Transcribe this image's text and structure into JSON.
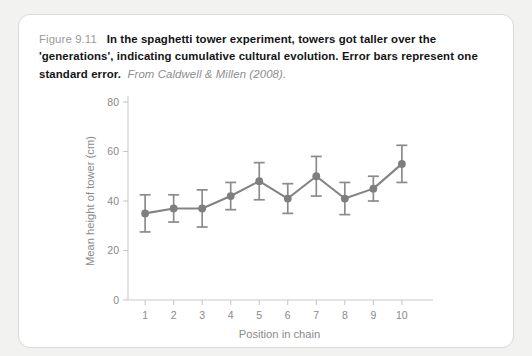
{
  "figure": {
    "label": "Figure 9.11",
    "caption_bold": "In the spaghetti tower experiment, towers got taller over the 'generations', indicating cumulative cultural evolution. Error bars represent one standard error.",
    "source": "From Caldwell & Millen (2008)."
  },
  "colors": {
    "series": "#7e7e7e",
    "axis": "#c9c9c9",
    "axis_text": "#8a8a8a",
    "card_border": "#d9d9d9",
    "page_background": "#f2f2f0",
    "card_background": "#ffffff"
  },
  "chart_data": {
    "type": "line",
    "title": "",
    "xlabel": "Position in chain",
    "ylabel": "Mean height of tower (cm)",
    "x": [
      1,
      2,
      3,
      4,
      5,
      6,
      7,
      8,
      9,
      10
    ],
    "categories": [
      "1",
      "2",
      "3",
      "4",
      "5",
      "6",
      "7",
      "8",
      "9",
      "10"
    ],
    "values": [
      35,
      37,
      37,
      42,
      48,
      41,
      50,
      41,
      45,
      55
    ],
    "errors": [
      7.5,
      5.5,
      7.5,
      5.5,
      7.5,
      6.0,
      8.0,
      6.5,
      5.0,
      7.5
    ],
    "xlim": [
      0.4,
      10.6
    ],
    "ylim": [
      0,
      80
    ],
    "yticks": [
      0,
      20,
      40,
      60,
      80
    ],
    "ytick_labels": [
      "0",
      "20",
      "40",
      "60",
      "80"
    ],
    "xticks": [
      1,
      2,
      3,
      4,
      5,
      6,
      7,
      8,
      9,
      10
    ],
    "xtick_labels": [
      "1",
      "2",
      "3",
      "4",
      "5",
      "6",
      "7",
      "8",
      "9",
      "10"
    ],
    "grid": false,
    "legend": "none",
    "marker": "circle",
    "error_bar_caps": true
  },
  "watermark": {
    "text": ""
  }
}
